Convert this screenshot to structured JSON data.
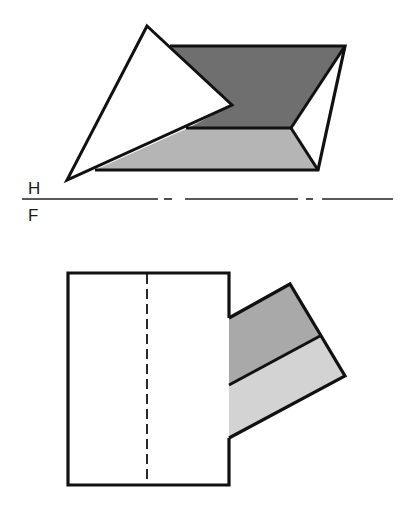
{
  "labels": {
    "horizontal_plane": "H",
    "frontal_plane": "F"
  },
  "colors": {
    "background": "#ffffff",
    "stroke": "#111111",
    "top_dark_face": "#6f6f6f",
    "top_light_face": "#b5b5b5",
    "front_upper_face": "#a9a9a9",
    "front_lower_face": "#d3d3d3",
    "white_face": "#ffffff"
  },
  "views": {
    "top_view": {
      "name": "Horizontal (top) view",
      "parallelogram": [
        [
          170,
          46
        ],
        [
          345,
          46
        ],
        [
          318,
          170
        ],
        [
          95,
          170
        ]
      ],
      "inner_vertex": [
        291,
        128
      ],
      "triangle_plane": [
        [
          147,
          26
        ],
        [
          232,
          105
        ],
        [
          67,
          180
        ]
      ]
    },
    "front_view": {
      "name": "Frontal view",
      "rectangle": {
        "x": 68,
        "y": 273,
        "w": 161,
        "h": 212
      },
      "hidden_line_x": 147,
      "prism": [
        [
          229,
          318
        ],
        [
          290,
          284
        ],
        [
          345,
          376
        ],
        [
          229,
          438
        ]
      ],
      "prism_mid_edge": [
        [
          229,
          385
        ],
        [
          319,
          336
        ]
      ]
    }
  },
  "fold_line": {
    "y": 199,
    "segments": [
      [
        22,
        158
      ],
      [
        164,
        172
      ],
      [
        185,
        298
      ],
      [
        306,
        313
      ],
      [
        322,
        393
      ]
    ]
  }
}
